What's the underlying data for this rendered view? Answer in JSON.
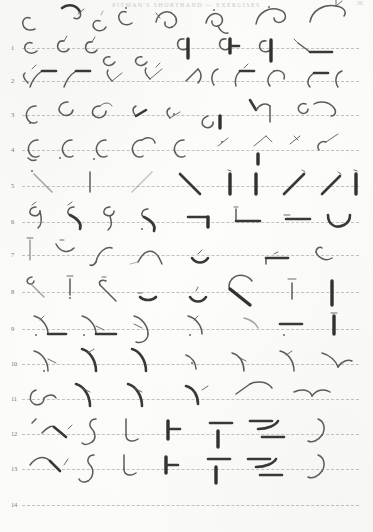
{
  "document": {
    "type": "shorthand-exercise-page",
    "header_title": "PITMAN'S SHORTHAND — EXERCISES",
    "page_number": "36",
    "background_color": "#fdfdfc",
    "ink_color": "#5d5b58",
    "rule_color": "#b9b7b4",
    "total_lines": 14
  },
  "lines": [
    {
      "number": "1",
      "outline_count": 7
    },
    {
      "number": "2",
      "outline_count": 8
    },
    {
      "number": "3",
      "outline_count": 9
    },
    {
      "number": "4",
      "outline_count": 8
    },
    {
      "number": "5",
      "outline_count": 9
    },
    {
      "number": "6",
      "outline_count": 8
    },
    {
      "number": "7",
      "outline_count": 8
    },
    {
      "number": "8",
      "outline_count": 8
    },
    {
      "number": "9",
      "outline_count": 9
    },
    {
      "number": "10",
      "outline_count": 8
    },
    {
      "number": "11",
      "outline_count": 8
    },
    {
      "number": "12",
      "outline_count": 8
    },
    {
      "number": "13",
      "outline_count": 8
    },
    {
      "number": "14",
      "outline_count": 9
    }
  ],
  "line_tops": [
    48,
    81,
    115,
    150,
    186,
    222,
    255,
    292,
    329,
    364,
    399,
    434,
    469,
    505
  ]
}
